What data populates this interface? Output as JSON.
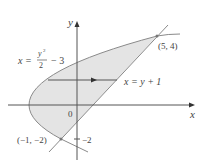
{
  "figure": {
    "colors": {
      "region_fill": "#e4e4e4",
      "curve": "#8a8a8a",
      "axis": "#555555",
      "text": "#444444"
    },
    "axes": {
      "x_label": "x",
      "y_label": "y",
      "origin_label": "0"
    },
    "curves": {
      "parabola_label_lhs": "x =",
      "parabola_numerator": "y",
      "parabola_exponent": "2",
      "parabola_denominator": "2",
      "parabola_rhs": "− 3",
      "line_label": "x = y + 1"
    },
    "points": [
      {
        "label": "(5, 4)"
      },
      {
        "label": "(−1, −2)"
      }
    ],
    "tick_labels": {
      "y_neg2": "−2"
    }
  }
}
